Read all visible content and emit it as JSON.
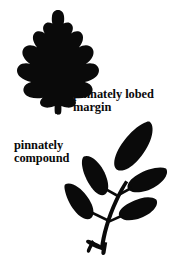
{
  "figure": {
    "background_color": "#ffffff",
    "ink_color": "#0a0a0a",
    "width": 182,
    "height": 260
  },
  "captions": {
    "lobed_margin": {
      "line1": "pinnately lobed",
      "line2": "margin"
    },
    "pinnately_compound": {
      "line1": "pinnately",
      "line2": "compound"
    }
  },
  "illustrations": {
    "oak_leaf": {
      "name": "pinnately lobed leaf silhouette",
      "fill": "#0a0a0a"
    },
    "compound_leaf": {
      "name": "pinnately compound leaf silhouette",
      "fill": "#0a0a0a",
      "leaflet_count": 5
    }
  }
}
